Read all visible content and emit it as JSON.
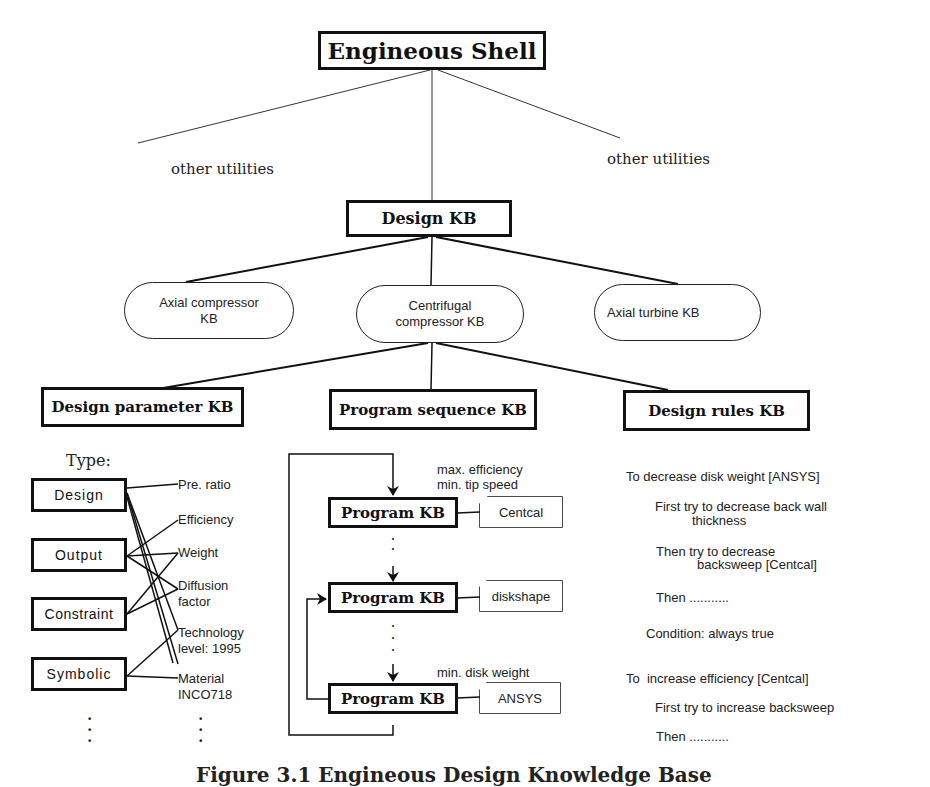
{
  "root": {
    "title": "Engineous Shell"
  },
  "utilities": {
    "left": "other utilities",
    "right": "other utilities"
  },
  "design_kb": {
    "title": "Design KB"
  },
  "component_kbs": [
    {
      "label_line1": "Axial compressor",
      "label_line2": "KB"
    },
    {
      "label_line1": "Centrifugal",
      "label_line2": "compressor KB"
    },
    {
      "label_line1": "Axial turbine KB",
      "label_line2": ""
    }
  ],
  "sub_kbs": [
    {
      "title": "Design parameter KB"
    },
    {
      "title": "Program sequence KB"
    },
    {
      "title": "Design rules KB"
    }
  ],
  "design_parameter": {
    "type_heading": "Type:",
    "types": [
      "Design",
      "Output",
      "Constraint",
      "Symbolic"
    ],
    "parameters": [
      {
        "line1": "Pre. ratio",
        "line2": ""
      },
      {
        "line1": "Efficiency",
        "line2": ""
      },
      {
        "line1": "Weight",
        "line2": ""
      },
      {
        "line1": "Diffusion",
        "line2": "factor"
      },
      {
        "line1": "Technology",
        "line2": "level:  1995"
      },
      {
        "line1": "Material",
        "line2": "INCO718"
      }
    ],
    "ellipsis": "⋮"
  },
  "program_sequence": {
    "programs": [
      {
        "label": "Program KB",
        "tool": "Centcal",
        "note_line1": "max. efficiency",
        "note_line2": "min. tip speed"
      },
      {
        "label": "Program KB",
        "tool": "diskshape",
        "note_line1": "",
        "note_line2": ""
      },
      {
        "label": "Program KB",
        "tool": "ANSYS",
        "note_line1": "min. disk weight",
        "note_line2": ""
      }
    ],
    "ellipsis": "⋮"
  },
  "design_rules": {
    "rules": [
      {
        "goal": "To decrease disk weight [ANSYS]",
        "step1_line1": "First try to decrease back wall",
        "step1_line2": "thickness",
        "step2_line1": "Then try to decrease",
        "step2_line2": "backsweep [Centcal]",
        "step3": "Then ...........",
        "condition": "Condition: always true"
      },
      {
        "goal": "To  increase efficiency [Centcal]",
        "step1_line1": "First try to increase backsweep",
        "step3": "Then ..........."
      }
    ]
  },
  "caption": {
    "text": "Figure 3.1  Engineous Design Knowledge Base"
  }
}
